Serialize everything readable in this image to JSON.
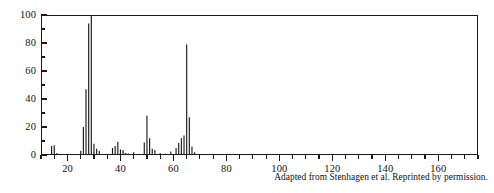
{
  "figure": {
    "title": "",
    "caption": "Adapted from Stenhagen et al. Reprinted by permission."
  },
  "chart_data": {
    "type": "bar",
    "title": "",
    "xlabel": "",
    "ylabel": "",
    "xlim": [
      10,
      175
    ],
    "ylim": [
      0,
      100
    ],
    "grid": false,
    "legend": null,
    "x_major_ticks": [
      20,
      40,
      60,
      80,
      100,
      120,
      140,
      160
    ],
    "x_minor_tick_interval": 5,
    "y_major_ticks": [
      0,
      20,
      40,
      60,
      80,
      100
    ],
    "y_minor_tick_interval": 10,
    "x_tick_labels": [
      "20",
      "40",
      "60",
      "80",
      "100",
      "120",
      "140",
      "160"
    ],
    "y_tick_labels": [
      "0",
      "20",
      "40",
      "60",
      "80",
      "100"
    ],
    "categories": [
      14,
      15,
      16,
      25,
      26,
      27,
      28,
      29,
      30,
      31,
      32,
      37,
      38,
      39,
      40,
      41,
      42,
      43,
      45,
      49,
      50,
      51,
      52,
      53,
      55,
      57,
      59,
      61,
      62,
      63,
      64,
      65,
      66,
      67,
      68
    ],
    "values": [
      6.5,
      7.0,
      1.5,
      3.0,
      20.0,
      47.0,
      94.0,
      100.0,
      8.0,
      4.5,
      3.0,
      5.0,
      6.5,
      9.5,
      4.0,
      3.5,
      1.5,
      1.0,
      2.0,
      9.0,
      28.0,
      12.0,
      4.5,
      3.5,
      1.5,
      1.0,
      2.5,
      5.0,
      8.5,
      12.0,
      14.0,
      79.0,
      27.0,
      6.0,
      2.0
    ],
    "series": [
      {
        "name": "relative intensity",
        "values": [
          6.5,
          7.0,
          1.5,
          3.0,
          20.0,
          47.0,
          94.0,
          100.0,
          8.0,
          4.5,
          3.0,
          5.0,
          6.5,
          9.5,
          4.0,
          3.5,
          1.5,
          1.0,
          2.0,
          9.0,
          28.0,
          12.0,
          4.5,
          3.5,
          1.5,
          1.0,
          2.5,
          5.0,
          8.5,
          12.0,
          14.0,
          79.0,
          27.0,
          6.0,
          2.0
        ]
      }
    ],
    "base_peak_mz": 29,
    "colors": {
      "line": "#1a1a1a",
      "axis": "#1a1a1a",
      "background": "#ffffff"
    }
  }
}
